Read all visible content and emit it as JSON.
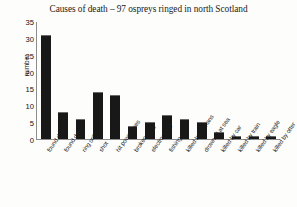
{
  "chart_data": {
    "type": "bar",
    "title": "Causes of death – 97 ospreys  ringed in north Scotland",
    "xlabel": "",
    "ylabel": "number",
    "ylim": [
      0,
      35
    ],
    "yticks": [
      0,
      5,
      10,
      15,
      20,
      25,
      30,
      35
    ],
    "grid": false,
    "legend": null,
    "bar_color": "#181818",
    "categories": [
      "found dead",
      "found dying",
      "ring only",
      "shot",
      "hit power lines",
      "broken wing",
      "electrocuted",
      "fishing gear",
      "killed by humans",
      "drowned at sea",
      "killed by car",
      "killed by train",
      "killed by eagle",
      "killed by otter"
    ],
    "values": [
      31,
      8,
      6,
      14,
      13,
      4,
      5,
      7,
      6,
      5,
      2,
      1,
      1,
      1
    ]
  }
}
